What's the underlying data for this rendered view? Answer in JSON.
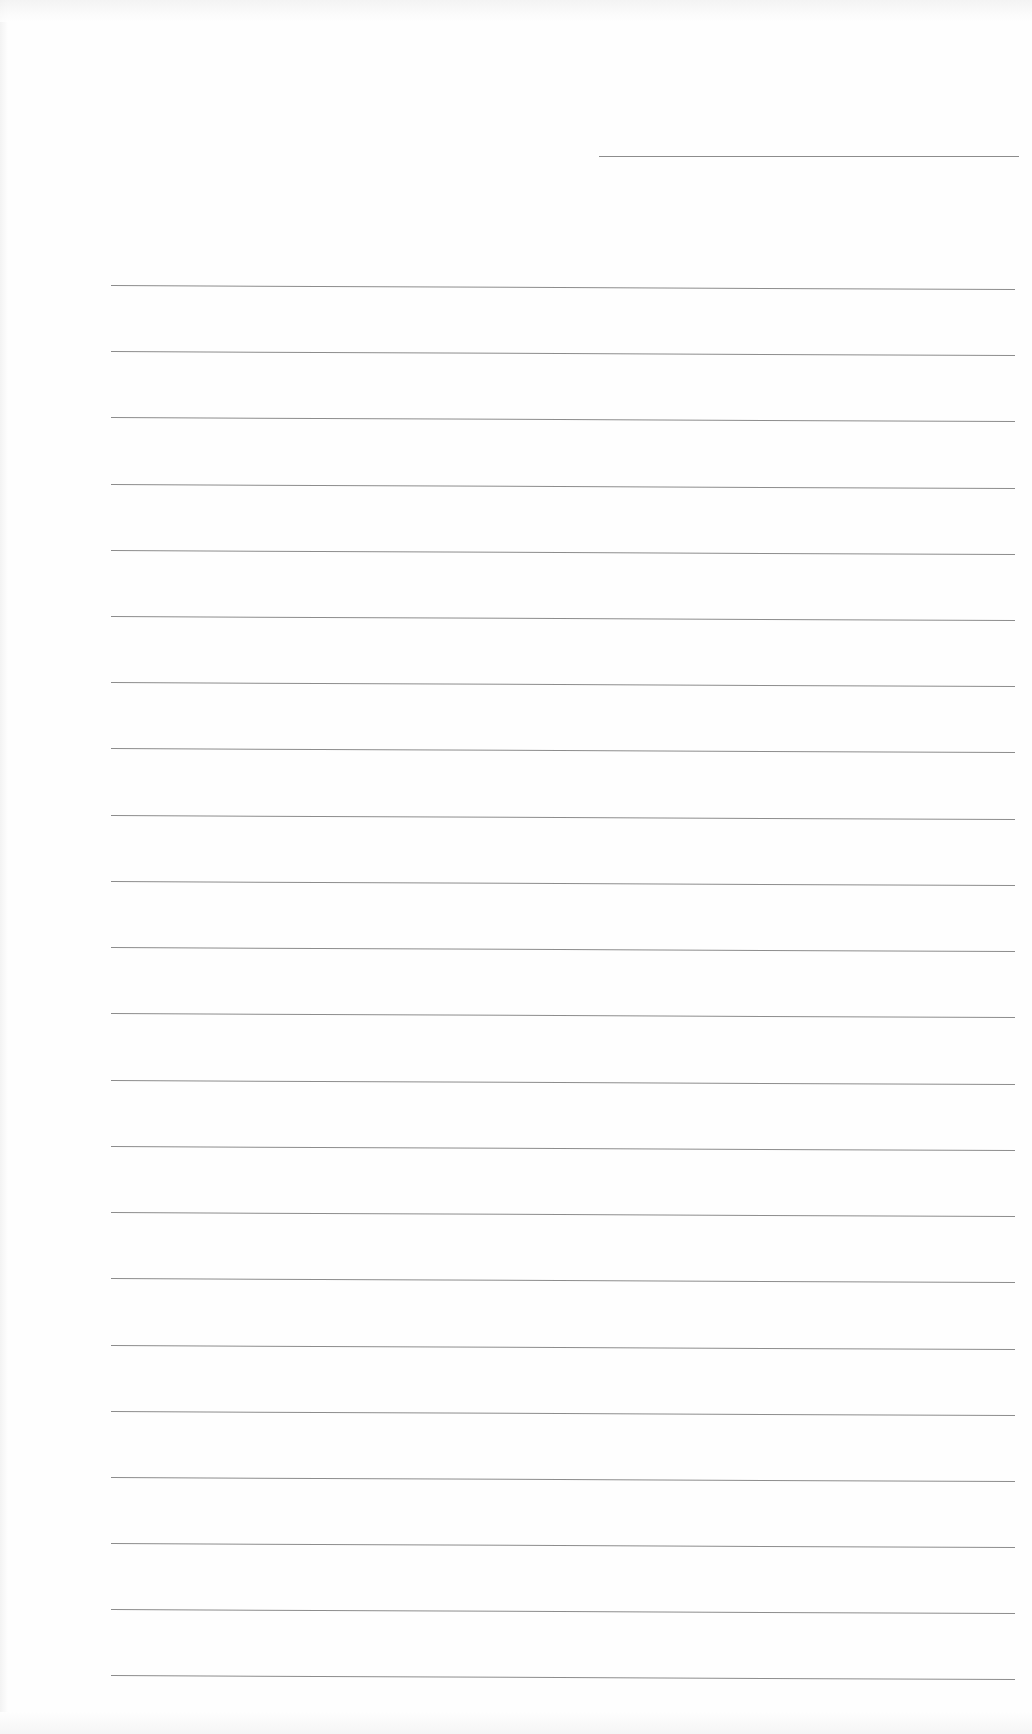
{
  "page": {
    "type": "blank lined writing paper",
    "background_color": "#fefefe",
    "line_color": "#8c8c8c",
    "header_line": {
      "x1": 599,
      "x2": 1019,
      "y": 156
    },
    "ruled_lines": {
      "x_start": 111,
      "x_end": 1015,
      "tilt_px": 4,
      "y_positions": [
        285,
        351,
        417,
        484,
        550,
        616,
        682,
        748,
        815,
        881,
        947,
        1013,
        1080,
        1146,
        1212,
        1278,
        1345,
        1411,
        1477,
        1543,
        1609,
        1675
      ]
    }
  }
}
